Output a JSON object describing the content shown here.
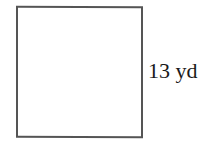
{
  "figure": {
    "shape": "square",
    "side_label": "13 yd",
    "side_length": 13,
    "unit": "yd",
    "stroke_color": "#555555"
  }
}
